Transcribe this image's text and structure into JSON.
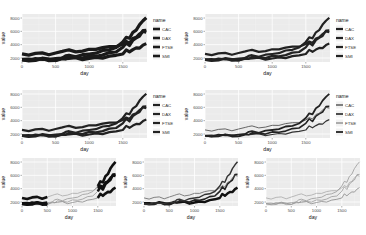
{
  "figure": {
    "background": "#ffffff",
    "panel_bg": "#ebebeb",
    "grid_color": "#ffffff",
    "line_color": "#222222"
  },
  "chart_data": [
    {
      "id": "p1",
      "type": "line",
      "title": "",
      "xlabel": "day",
      "ylabel": "value",
      "legend_title": "name",
      "legend": [
        "CAC",
        "DAX",
        "FTSE",
        "SMI"
      ],
      "xticks": [
        0,
        500,
        1000,
        1500
      ],
      "yticks": [
        2000,
        4000,
        6000,
        8000
      ],
      "xlim": [
        0,
        1860
      ],
      "ylim": [
        1400,
        8600
      ],
      "style": "thick-all",
      "legend_position": "right"
    },
    {
      "id": "p2",
      "type": "line",
      "title": "",
      "xlabel": "day",
      "ylabel": "value",
      "legend_title": "name",
      "legend": [
        "CAC",
        "DAX",
        "FTSE",
        "SMI"
      ],
      "xticks": [
        0,
        500,
        1000,
        1500
      ],
      "yticks": [
        2000,
        4000,
        6000,
        8000
      ],
      "xlim": [
        0,
        1860
      ],
      "ylim": [
        1400,
        8600
      ],
      "style": "medium-all",
      "legend_position": "right"
    },
    {
      "id": "p3",
      "type": "line",
      "title": "",
      "xlabel": "day",
      "ylabel": "value",
      "legend_title": "name",
      "legend": [
        "CAC",
        "DAX",
        "FTSE",
        "SMI"
      ],
      "xticks": [
        0,
        500,
        1000,
        1500
      ],
      "yticks": [
        2000,
        4000,
        6000,
        8000
      ],
      "xlim": [
        0,
        1860
      ],
      "ylim": [
        1400,
        8600
      ],
      "style": "medium-all",
      "legend_position": "right"
    },
    {
      "id": "p4",
      "type": "line",
      "title": "",
      "xlabel": "day",
      "ylabel": "value",
      "legend_title": "name",
      "legend": [
        "CAC",
        "DAX",
        "FTSE",
        "SMI"
      ],
      "xticks": [
        0,
        500,
        1000,
        1500
      ],
      "yticks": [
        2000,
        4000,
        6000,
        8000
      ],
      "xlim": [
        0,
        1860
      ],
      "ylim": [
        1400,
        8600
      ],
      "style": "thin-all",
      "legend_position": "right"
    },
    {
      "id": "p5",
      "type": "line",
      "title": "",
      "xlabel": "day",
      "ylabel": "value",
      "xticks": [
        0,
        500,
        1000,
        1500
      ],
      "yticks": [
        2000,
        4000,
        6000,
        8000
      ],
      "xlim": [
        0,
        1860
      ],
      "ylim": [
        1400,
        8600
      ],
      "style": "highlight-ends",
      "legend_position": "none"
    },
    {
      "id": "p6",
      "type": "line",
      "title": "",
      "xlabel": "day",
      "ylabel": "value",
      "xticks": [
        0,
        500,
        1000,
        1500
      ],
      "yticks": [
        2000,
        4000,
        6000,
        8000
      ],
      "xlim": [
        0,
        1860
      ],
      "ylim": [
        1400,
        8600
      ],
      "style": "highlight-lower",
      "legend_position": "none"
    },
    {
      "id": "p7",
      "type": "line",
      "title": "",
      "xlabel": "day",
      "ylabel": "value",
      "xticks": [
        0,
        500,
        1000,
        1500
      ],
      "yticks": [
        2000,
        4000,
        6000,
        8000
      ],
      "xlim": [
        0,
        1860
      ],
      "ylim": [
        1400,
        8600
      ],
      "style": "faint",
      "legend_position": "none"
    }
  ],
  "series_shape": {
    "x": [
      0,
      100,
      200,
      300,
      400,
      500,
      600,
      650,
      700,
      800,
      900,
      1000,
      1100,
      1200,
      1300,
      1400,
      1500,
      1550,
      1600,
      1650,
      1700,
      1750,
      1800,
      1850
    ],
    "series": [
      {
        "name": "CAC",
        "values": [
          1800,
          1750,
          1850,
          1900,
          1800,
          1750,
          1900,
          1950,
          2000,
          1950,
          1850,
          1900,
          2000,
          2100,
          2200,
          2400,
          2700,
          3100,
          3000,
          3300,
          3400,
          3600,
          3900,
          4100
        ]
      },
      {
        "name": "DAX",
        "values": [
          1650,
          1600,
          1700,
          1800,
          1700,
          1650,
          1800,
          2000,
          2100,
          2050,
          2100,
          2200,
          2300,
          2500,
          2700,
          3000,
          3600,
          4200,
          4000,
          4600,
          5000,
          5400,
          6000,
          6200
        ]
      },
      {
        "name": "FTSE",
        "values": [
          2500,
          2550,
          2650,
          2700,
          2600,
          2650,
          3000,
          3200,
          3100,
          3000,
          3050,
          3200,
          3400,
          3500,
          3650,
          3800,
          4000,
          4500,
          4300,
          4800,
          5200,
          5600,
          5900,
          6000
        ]
      },
      {
        "name": "SMI",
        "values": [
          1700,
          1750,
          1800,
          1850,
          1850,
          1800,
          2100,
          2300,
          2350,
          2300,
          2400,
          2600,
          2800,
          3000,
          3300,
          3600,
          4300,
          5200,
          4900,
          5800,
          6300,
          6900,
          7600,
          8100
        ]
      }
    ]
  }
}
